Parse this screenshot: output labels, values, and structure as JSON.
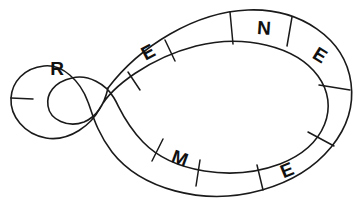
{
  "figure": {
    "kind": "figure-eight-band-diagram",
    "title": "",
    "stroke_color": "#1a1a1a",
    "background_color": "#ffffff",
    "fill_color": "none",
    "canvas": {
      "width": 359,
      "height": 213
    },
    "segment_letters": [
      "R",
      "E",
      "N",
      "E",
      "E",
      "M",
      "E"
    ],
    "segments": [
      {
        "id": "seg-r",
        "letter": "R",
        "loop": "left-loop",
        "position": "upper-left",
        "cx": 57,
        "cy": 68,
        "rotate": 0
      },
      {
        "id": "seg-e1",
        "letter": "E",
        "loop": "right-loop",
        "position": "upper-left",
        "cx": 148,
        "cy": 52,
        "rotate": -28
      },
      {
        "id": "seg-n",
        "letter": "N",
        "loop": "right-loop",
        "position": "top",
        "cx": 264,
        "cy": 28,
        "rotate": 5
      },
      {
        "id": "seg-e2",
        "letter": "E",
        "loop": "right-loop",
        "position": "upper-right",
        "cx": 320,
        "cy": 55,
        "rotate": 32
      },
      {
        "id": "seg-e3",
        "letter": "E",
        "loop": "right-loop",
        "position": "lower-right",
        "cx": 287,
        "cy": 170,
        "rotate": -22
      },
      {
        "id": "seg-m",
        "letter": "M",
        "loop": "right-loop",
        "position": "bottom-left",
        "cx": 180,
        "cy": 158,
        "rotate": 20
      },
      {
        "id": "seg-e4",
        "letter": "E",
        "loop": "left-loop",
        "position": "blank",
        "cx": -100,
        "cy": -100,
        "rotate": 0
      }
    ],
    "divider_count": 10,
    "crossing_point": {
      "x": 108,
      "y": 97
    }
  }
}
